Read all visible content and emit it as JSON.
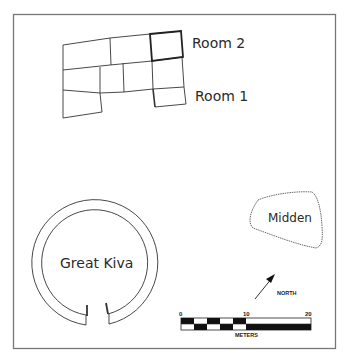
{
  "map": {
    "labels": {
      "room2": "Room 2",
      "room1": "Room 1",
      "midden": "Midden",
      "great_kiva": "Great Kiva",
      "north": "NORTH"
    },
    "scale_bar": {
      "ticks": [
        "0",
        "10",
        "20"
      ],
      "unit": "METERS"
    },
    "colors": {
      "line": "#333333",
      "border": "#777777",
      "fill_dark": "#111111",
      "background": "#ffffff"
    }
  }
}
